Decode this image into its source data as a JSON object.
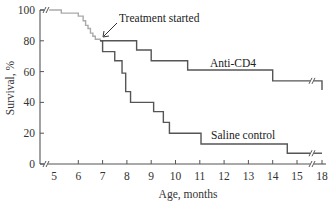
{
  "chart_data": {
    "type": "line",
    "subtype": "step (Kaplan-Meier survival)",
    "title": "",
    "xlabel": "Age, months",
    "ylabel": "Survival, %",
    "x_ticks": [
      5,
      6,
      7,
      8,
      9,
      10,
      11,
      12,
      13,
      14,
      15,
      18
    ],
    "y_ticks": [
      0,
      20,
      40,
      60,
      80,
      100
    ],
    "xlim": [
      4.7,
      18.2
    ],
    "ylim": [
      0,
      100
    ],
    "x_axis_break": [
      15.5,
      17.5
    ],
    "grid": false,
    "legend": "inline labels",
    "colors": {
      "pre_treatment": "#aaaaaa",
      "anti_cd4": "#555555",
      "saline": "#555555",
      "axis": "#555555"
    },
    "series": [
      {
        "name": "Pre-treatment (all mice)",
        "x": [
          4.8,
          5.3,
          6.0,
          6.2,
          6.3,
          6.4,
          6.5,
          6.6,
          6.7,
          6.9
        ],
        "y": [
          100,
          98,
          96,
          93,
          90,
          88,
          85,
          83,
          81,
          80
        ]
      },
      {
        "name": "Anti-CD4",
        "x": [
          6.9,
          8.4,
          9.0,
          10.5,
          14.0,
          18.0
        ],
        "y": [
          80,
          74,
          67,
          61,
          54,
          48
        ]
      },
      {
        "name": "Saline control",
        "x": [
          6.9,
          7.0,
          7.5,
          7.8,
          7.95,
          8.15,
          9.1,
          9.5,
          9.75,
          11.05,
          14.6,
          18.0
        ],
        "y": [
          80,
          73,
          67,
          59,
          47,
          40,
          34,
          27,
          20,
          13,
          7,
          7
        ]
      }
    ],
    "annotations": [
      {
        "text": "Treatment started",
        "arrow_to": [
          6.9,
          80
        ]
      },
      {
        "text": "Anti-CD4",
        "near_series": "Anti-CD4"
      },
      {
        "text": "Saline control",
        "near_series": "Saline control"
      }
    ]
  },
  "labels": {
    "ylabel": "Survival, %",
    "xlabel": "Age, months",
    "treatment": "Treatment started",
    "anti_cd4": "Anti-CD4",
    "saline": "Saline control",
    "y_ticks": [
      "100",
      "80",
      "60",
      "40",
      "20",
      "0"
    ],
    "x_ticks": [
      "5",
      "6",
      "7",
      "8",
      "9",
      "10",
      "11",
      "12",
      "13",
      "14",
      "15",
      "18"
    ]
  }
}
